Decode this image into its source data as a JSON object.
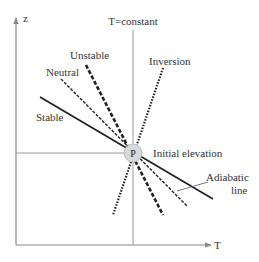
{
  "diagram": {
    "axes": {
      "y_label": "z",
      "x_label": "T"
    },
    "isotherm_label": "T=constant",
    "point_label": "P",
    "initial_elevation_label": "Initial elevation",
    "lines": [
      {
        "name": "Stable",
        "style": "solid"
      },
      {
        "name": "Neutral",
        "style": "dashed"
      },
      {
        "name": "Unstable",
        "style": "bold-dashed"
      },
      {
        "name": "Inversion",
        "style": "dotted"
      }
    ],
    "adiabatic_label_line1": "Adiabatic",
    "adiabatic_label_line2": "line",
    "colors": {
      "axis": "#8a8a8a",
      "lines": "#222222",
      "point_fill": "#d9d9d9"
    }
  }
}
